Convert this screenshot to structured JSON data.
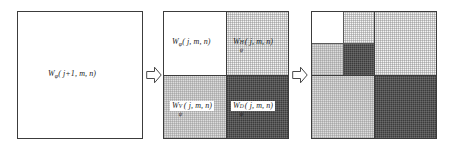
{
  "figure": {
    "colors": {
      "outline": "#3c3c3c",
      "approx_fill": "#ffffff",
      "horizontal_fill": "#f4f4f4",
      "vertical_fill": "#dcdcdc",
      "diagonal_fill": "#3c3c3c"
    }
  },
  "panels": [
    {
      "name": "input-scale-j-plus-1",
      "label": {
        "W": "W",
        "sub": "φ",
        "sup": "",
        "args": "( j+1, m, n)"
      }
    },
    {
      "name": "one-level-decomposition",
      "quadrants": [
        {
          "name": "approximation",
          "position": "top-left",
          "fill": "white",
          "label": {
            "W": "W",
            "sub": "φ",
            "sup": "",
            "args": "( j, m, n)"
          }
        },
        {
          "name": "horizontal-detail",
          "position": "top-right",
          "fill": "dot",
          "label": {
            "W": "W",
            "sub": "ψ",
            "sup": "H",
            "args": "( j, m, n)"
          }
        },
        {
          "name": "vertical-detail",
          "position": "bottom-left",
          "fill": "lightgray",
          "label": {
            "W": "W",
            "sub": "ψ",
            "sup": "V",
            "args": "( j, m, n)"
          }
        },
        {
          "name": "diagonal-detail",
          "position": "bottom-right",
          "fill": "dark",
          "label": {
            "W": "W",
            "sub": "ψ",
            "sup": "D",
            "args": "( j, m, n)"
          }
        }
      ]
    },
    {
      "name": "two-level-decomposition",
      "quadrants": [
        {
          "name": "approximation-level2",
          "position": "top-left-inner-top-left",
          "fill": "white"
        },
        {
          "name": "horizontal-detail-level2",
          "position": "top-left-inner-top-right",
          "fill": "dot"
        },
        {
          "name": "vertical-detail-level2",
          "position": "top-left-inner-bottom-left",
          "fill": "lightgray"
        },
        {
          "name": "diagonal-detail-level2",
          "position": "top-left-inner-bottom-right",
          "fill": "dark"
        },
        {
          "name": "horizontal-detail-level1",
          "position": "top-right",
          "fill": "dot"
        },
        {
          "name": "vertical-detail-level1",
          "position": "bottom-left",
          "fill": "lightgray"
        },
        {
          "name": "diagonal-detail-level1",
          "position": "bottom-right",
          "fill": "dark"
        }
      ]
    }
  ],
  "arrows": [
    {
      "name": "arrow-panel1-to-panel2",
      "direction": "right"
    },
    {
      "name": "arrow-panel2-to-panel3",
      "direction": "right"
    }
  ]
}
